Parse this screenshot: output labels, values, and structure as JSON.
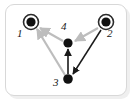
{
  "figure": {
    "type": "directed-graph",
    "title": "",
    "frame": {
      "shape": "rounded-rectangle",
      "border_color": "#d8d8d8",
      "background_color": "#ffffff"
    }
  },
  "nodes": [
    {
      "id": "1",
      "label": "1",
      "style": "double-circle",
      "fill_color": "#111111",
      "ring_color": "#2b2b2b",
      "x": 31,
      "y": 22,
      "radius": 7.5,
      "label_x": 17,
      "label_y": 28
    },
    {
      "id": "2",
      "label": "2",
      "style": "double-circle",
      "fill_color": "#111111",
      "ring_color": "#2b2b2b",
      "x": 106,
      "y": 22,
      "radius": 7.5,
      "label_x": 107,
      "label_y": 28
    },
    {
      "id": "3",
      "label": "3",
      "style": "filled-dot",
      "fill_color": "#111111",
      "x": 68,
      "y": 79,
      "radius": 4.5,
      "label_x": 53,
      "label_y": 77
    },
    {
      "id": "4",
      "label": "4",
      "style": "filled-dot",
      "fill_color": "#111111",
      "x": 68,
      "y": 43,
      "radius": 4.5,
      "label_x": 61,
      "label_y": 21
    }
  ],
  "edges": [
    {
      "id": "edge-4-1",
      "from": "4",
      "to": "1",
      "color": "#bdbdbd",
      "arrowhead": "at-target",
      "style": "solid"
    },
    {
      "id": "edge-3-1",
      "from": "3",
      "to": "1",
      "color": "#bdbdbd",
      "arrowhead": "at-target",
      "style": "solid"
    },
    {
      "id": "edge-2-4",
      "from": "2",
      "to": "4",
      "color": "#bdbdbd",
      "arrowhead": "at-target",
      "style": "solid"
    },
    {
      "id": "edge-3-4",
      "from": "3",
      "to": "4",
      "color": "#1a1a1a",
      "arrowhead": "at-target",
      "style": "solid"
    },
    {
      "id": "edge-2-3",
      "from": "2",
      "to": "3",
      "color": "#1a1a1a",
      "arrowhead": "at-target",
      "style": "solid"
    }
  ],
  "colors": {
    "node_fill": "#111111",
    "light_edge": "#bdbdbd",
    "dark_edge": "#1a1a1a",
    "frame_border": "#d8d8d8",
    "frame_shadow": "#efefef",
    "label_text": "#1a1a1a"
  }
}
